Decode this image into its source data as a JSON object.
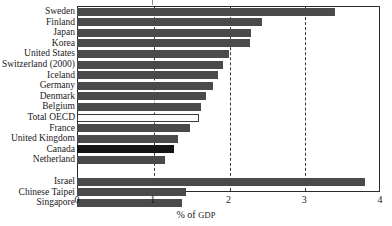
{
  "chart_data": {
    "type": "bar",
    "orientation": "horizontal",
    "title": "",
    "xlabel": "% of GDP",
    "ylabel": "",
    "xlim": [
      0,
      4
    ],
    "xticks": [
      0,
      1,
      2,
      3,
      4
    ],
    "xtick_labels": [
      "0",
      "1",
      "2",
      "3",
      "4"
    ],
    "grid": "vertical-dashed-at-1-2-3",
    "legend": "none",
    "categories": [
      "Sweden",
      "Finland",
      "Japan",
      "Korea",
      "United States",
      "Switzerland (2000)",
      "Iceland",
      "Germany",
      "Denmark",
      "Belgium",
      "Total OECD",
      "France",
      "United Kingdom",
      "Canada",
      "Netherland",
      "Israel",
      "Chinese Taipei",
      "Singapore"
    ],
    "values": [
      3.41,
      2.44,
      2.3,
      2.28,
      2.0,
      1.93,
      1.86,
      1.79,
      1.7,
      1.64,
      1.61,
      1.49,
      1.33,
      1.28,
      1.16,
      3.8,
      1.44,
      1.39
    ],
    "styles": [
      "dark",
      "dark",
      "dark",
      "dark",
      "dark",
      "dark",
      "dark",
      "dark",
      "dark",
      "dark",
      "white",
      "dark",
      "dark",
      "black",
      "dark",
      "dark",
      "dark",
      "dark"
    ],
    "group_break_after_index": 14,
    "colors": {
      "bar_dark": "#4a4a4a",
      "bar_black": "#141414",
      "bar_white": "#ffffff",
      "axis": "#2b2b2b",
      "gridline": "#3a3a3a",
      "text": "#1a1a1a",
      "background": "#ffffff"
    }
  },
  "axis": {
    "x_label_prefix": "% of ",
    "x_label_smallcaps": "GDP"
  }
}
